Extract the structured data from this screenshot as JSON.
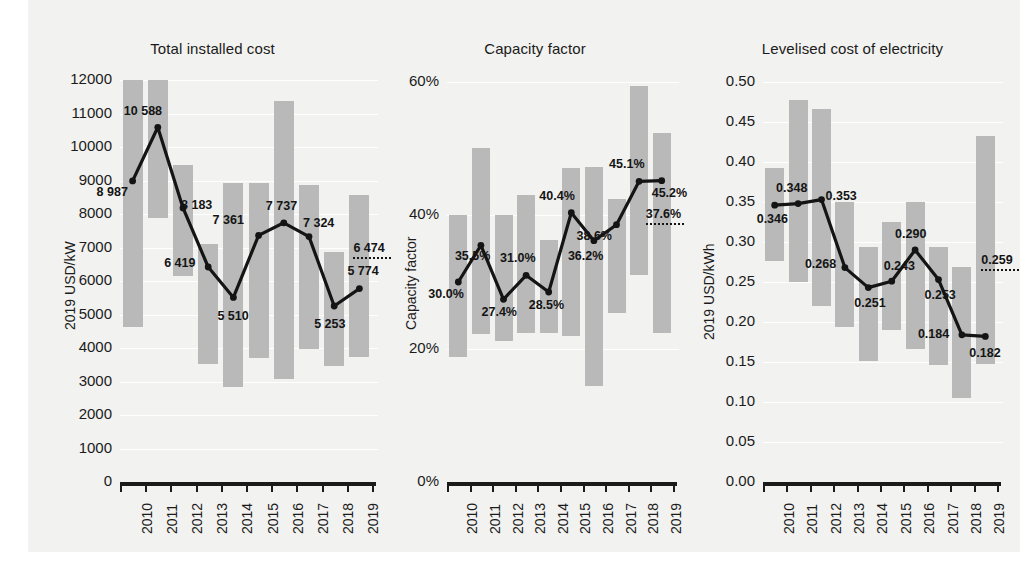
{
  "figure": {
    "background_color": "#f2f2f0",
    "bar_color": "#b9b9b9",
    "line_color": "#141414",
    "grid_color": "#ffffff"
  },
  "chart_data": [
    {
      "type": "line",
      "title": "Total installed cost",
      "xlabel": "",
      "ylabel": "2019 USD/kW",
      "categories": [
        "2010",
        "2011",
        "2012",
        "2013",
        "2014",
        "2015",
        "2016",
        "2017",
        "2018",
        "2019"
      ],
      "ylim": [
        0,
        12000
      ],
      "yticks": [
        0,
        1000,
        2000,
        3000,
        4000,
        5000,
        6000,
        7000,
        8000,
        9000,
        10000,
        11000,
        12000
      ],
      "ytick_labels": [
        "0",
        "1000",
        "2000",
        "3000",
        "4000",
        "5000",
        "6000",
        "7000",
        "8000",
        "9000",
        "10000",
        "11000",
        "12000"
      ],
      "grid": true,
      "legend": "none",
      "series": [
        {
          "name": "Capacity weighted average",
          "values": [
            8987,
            10588,
            8183,
            6419,
            5510,
            7361,
            7737,
            7324,
            5253,
            5774
          ],
          "labels": [
            "8 987",
            "10 588",
            "8 183",
            "6 419",
            "5 510",
            "7 361",
            "7 737",
            "7 324",
            "5 253",
            "5 774"
          ]
        }
      ],
      "ranges": [
        {
          "year": "2010",
          "low": 4620,
          "high": 12000
        },
        {
          "year": "2011",
          "low": 7880,
          "high": 12000
        },
        {
          "year": "2012",
          "low": 6160,
          "high": 9470
        },
        {
          "year": "2013",
          "low": 3520,
          "high": 7110
        },
        {
          "year": "2014",
          "low": 2850,
          "high": 8930
        },
        {
          "year": "2015",
          "low": 3700,
          "high": 8930
        },
        {
          "year": "2016",
          "low": 3060,
          "high": 11380
        },
        {
          "year": "2017",
          "low": 3970,
          "high": 8880
        },
        {
          "year": "2018",
          "low": 3450,
          "high": 6860
        },
        {
          "year": "2019",
          "low": 3720,
          "high": 8580
        }
      ],
      "reference_marker": {
        "label": "6 474",
        "value": 6474,
        "style": "dotted"
      }
    },
    {
      "type": "line",
      "title": "Capacity factor",
      "xlabel": "",
      "ylabel": "Capacity factor",
      "categories": [
        "2010",
        "2011",
        "2012",
        "2013",
        "2014",
        "2015",
        "2016",
        "2017",
        "2018",
        "2019"
      ],
      "ylim": [
        0,
        60
      ],
      "yticks": [
        0,
        20,
        40,
        60
      ],
      "ytick_labels": [
        "0%",
        "20%",
        "40%",
        "60%"
      ],
      "grid": true,
      "legend": "none",
      "series": [
        {
          "name": "Capacity weighted average",
          "values": [
            30.0,
            35.5,
            27.4,
            31.0,
            28.5,
            40.4,
            36.2,
            38.6,
            45.1,
            45.2
          ],
          "labels": [
            "30.0%",
            "35.5%",
            "27.4%",
            "31.0%",
            "28.5%",
            "40.4%",
            "36.2%",
            "38.6%",
            "45.1%",
            "45.2%"
          ]
        }
      ],
      "ranges": [
        {
          "year": "2010",
          "low": 18.8,
          "high": 40.0
        },
        {
          "year": "2011",
          "low": 22.2,
          "high": 50.1
        },
        {
          "year": "2012",
          "low": 21.2,
          "high": 40.0
        },
        {
          "year": "2013",
          "low": 22.3,
          "high": 43.0
        },
        {
          "year": "2014",
          "low": 22.4,
          "high": 36.3
        },
        {
          "year": "2015",
          "low": 21.9,
          "high": 47.1
        },
        {
          "year": "2016",
          "low": 14.4,
          "high": 47.3
        },
        {
          "year": "2017",
          "low": 25.3,
          "high": 42.5
        },
        {
          "year": "2018",
          "low": 31.0,
          "high": 59.4
        },
        {
          "year": "2019",
          "low": 22.4,
          "high": 52.4
        }
      ],
      "reference_marker": {
        "label": "37.6%",
        "value": 37.6,
        "style": "dotted"
      }
    },
    {
      "type": "line",
      "title": "Levelised cost of electricity",
      "xlabel": "",
      "ylabel": "2019 USD/kWh",
      "categories": [
        "2010",
        "2011",
        "2012",
        "2013",
        "2014",
        "2015",
        "2016",
        "2017",
        "2018",
        "2019"
      ],
      "ylim": [
        0.0,
        0.5
      ],
      "yticks": [
        0.0,
        0.05,
        0.1,
        0.15,
        0.2,
        0.25,
        0.3,
        0.35,
        0.4,
        0.45,
        0.5
      ],
      "ytick_labels": [
        "0.00",
        "0.05",
        "0.10",
        "0.15",
        "0.20",
        "0.25",
        "0.30",
        "0.35",
        "0.40",
        "0.45",
        "0.50"
      ],
      "grid": true,
      "legend": "none",
      "series": [
        {
          "name": "Capacity weighted average",
          "values": [
            0.346,
            0.348,
            0.353,
            0.268,
            0.243,
            0.251,
            0.29,
            0.253,
            0.184,
            0.182
          ],
          "labels": [
            "0.346",
            "0.348",
            "0.353",
            "0.268",
            "0.251",
            "0.243",
            "0.290",
            "0.253",
            "0.184",
            "0.182"
          ]
        }
      ],
      "ranges": [
        {
          "year": "2010",
          "low": 0.276,
          "high": 0.392
        },
        {
          "year": "2011",
          "low": 0.25,
          "high": 0.477
        },
        {
          "year": "2012",
          "low": 0.22,
          "high": 0.466
        },
        {
          "year": "2013",
          "low": 0.194,
          "high": 0.35
        },
        {
          "year": "2014",
          "low": 0.151,
          "high": 0.294
        },
        {
          "year": "2015",
          "low": 0.19,
          "high": 0.325
        },
        {
          "year": "2016",
          "low": 0.166,
          "high": 0.35
        },
        {
          "year": "2017",
          "low": 0.146,
          "high": 0.294
        },
        {
          "year": "2018",
          "low": 0.105,
          "high": 0.269
        },
        {
          "year": "2019",
          "low": 0.147,
          "high": 0.432
        }
      ],
      "reference_marker": {
        "label": "0.259",
        "value": 0.259,
        "style": "dotted"
      }
    }
  ],
  "panels": [
    {
      "title": "Total installed cost",
      "ylabel": "2019 USD/kW",
      "ytick_labels": [
        "12000",
        "11000",
        "10000",
        "9000",
        "8000",
        "7000",
        "6000",
        "5000",
        "4000",
        "3000",
        "2000",
        "1000",
        "0"
      ],
      "xtick_labels": [
        "2010",
        "2011",
        "2012",
        "2013",
        "2014",
        "2015",
        "2016",
        "2017",
        "2018",
        "2019"
      ],
      "point_labels": [
        "8 987",
        "10 588",
        "8 183",
        "6 419",
        "5 510",
        "7 361",
        "7 737",
        "7 324",
        "5 253",
        "5 774"
      ],
      "ref_label": "6 474"
    },
    {
      "title": "Capacity factor",
      "ylabel": "Capacity factor",
      "ytick_labels": [
        "60%",
        "40%",
        "20%",
        "0%"
      ],
      "xtick_labels": [
        "2010",
        "2011",
        "2012",
        "2013",
        "2014",
        "2015",
        "2016",
        "2017",
        "2018",
        "2019"
      ],
      "point_labels": [
        "30.0%",
        "35.5%",
        "27.4%",
        "31.0%",
        "28.5%",
        "40.4%",
        "36.2%",
        "38.6%",
        "45.1%",
        "45.2%"
      ],
      "ref_label": "37.6%"
    },
    {
      "title": "Levelised cost of electricity",
      "ylabel": "2019 USD/kWh",
      "ytick_labels": [
        "0.50",
        "0.45",
        "0.40",
        "0.35",
        "0.30",
        "0.25",
        "0.20",
        "0.15",
        "0.10",
        "0.05",
        "0.00"
      ],
      "xtick_labels": [
        "2010",
        "2011",
        "2012",
        "2013",
        "2014",
        "2015",
        "2016",
        "2017",
        "2018",
        "2019"
      ],
      "point_labels": [
        "0.346",
        "0.348",
        "0.353",
        "0.268",
        "0.243",
        "0.251",
        "0.290",
        "0.253",
        "0.184",
        "0.182"
      ],
      "ref_label": "0.259"
    }
  ]
}
